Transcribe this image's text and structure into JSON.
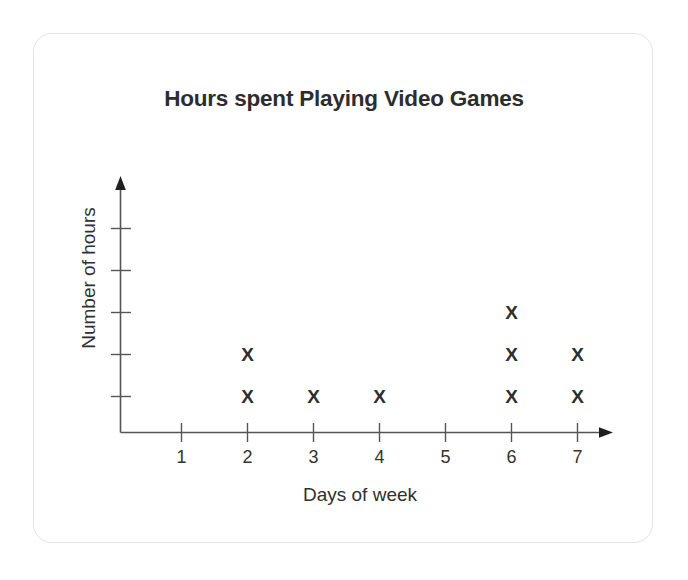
{
  "card": {
    "background": "#ffffff",
    "border_color": "#e3e3e3"
  },
  "chart_data": {
    "type": "scatter",
    "title": "Hours spent Playing Video Games",
    "xlabel": "Days of week",
    "ylabel": "Number of hours",
    "categories": [
      "1",
      "2",
      "3",
      "4",
      "5",
      "6",
      "7"
    ],
    "x": [
      1,
      2,
      3,
      4,
      5,
      6,
      7
    ],
    "values": [
      0,
      2,
      1,
      1,
      0,
      3,
      2
    ],
    "marker": "X",
    "marker_color": "#2e2e2e",
    "xlim": [
      0,
      7.6
    ],
    "ylim": [
      0,
      5
    ],
    "x_ticks": [
      "1",
      "2",
      "3",
      "4",
      "5",
      "6",
      "7"
    ],
    "y_ticks": [
      "",
      "",
      "",
      "",
      ""
    ],
    "y_tick_count": 5,
    "grid": false,
    "legend": false,
    "axis_color": "#555555",
    "points": [
      {
        "day": 2,
        "stack": 1
      },
      {
        "day": 2,
        "stack": 2
      },
      {
        "day": 3,
        "stack": 1
      },
      {
        "day": 4,
        "stack": 1
      },
      {
        "day": 6,
        "stack": 1
      },
      {
        "day": 6,
        "stack": 2
      },
      {
        "day": 6,
        "stack": 3
      },
      {
        "day": 7,
        "stack": 1
      },
      {
        "day": 7,
        "stack": 2
      }
    ]
  }
}
